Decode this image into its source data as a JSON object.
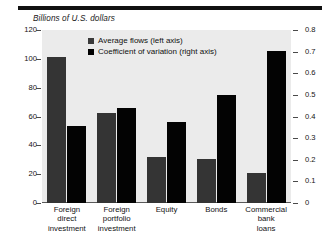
{
  "figure": {
    "axis_title": "Billions of U.S. dollars",
    "top_rule": "horizontal-rule"
  },
  "chart_data": {
    "type": "bar",
    "title": "Billions of U.S. dollars",
    "xlabel": "",
    "ylabel": "Billions of U.S. dollars",
    "y2label": "Coefficient of variation",
    "ylim": [
      0,
      120
    ],
    "y2lim": [
      0,
      0.8
    ],
    "grid": false,
    "legend_position": "top-center",
    "categories": [
      "Foreign direct investment",
      "Foreign portfolio investment",
      "Equity",
      "Bonds",
      "Commercial bank loans"
    ],
    "category_lines": [
      [
        "Foreign",
        "direct",
        "investment"
      ],
      [
        "Foreign",
        "portfolio",
        "investment"
      ],
      [
        "Equity"
      ],
      [
        "Bonds"
      ],
      [
        "Commercial",
        "bank",
        "loans"
      ]
    ],
    "series": [
      {
        "name": "Average flows (left axis)",
        "axis": "left",
        "color": "#343434",
        "values": [
          101,
          62.5,
          32,
          30.5,
          21
        ]
      },
      {
        "name": "Coefficient of variation (right axis)",
        "axis": "right",
        "color": "#030303",
        "values": [
          0.355,
          0.44,
          0.375,
          0.5,
          0.705
        ]
      }
    ],
    "yticks_left": [
      "0",
      "20",
      "40",
      "60",
      "80",
      "100",
      "120"
    ],
    "yticks_left_values": [
      0,
      20,
      40,
      60,
      80,
      100,
      120
    ],
    "yticks_right": [
      "0",
      "0.1",
      "0.2",
      "0.3",
      "0.4",
      "0.5",
      "0.6",
      "0.7",
      "0.8"
    ],
    "yticks_right_values": [
      0,
      0.1,
      0.2,
      0.3,
      0.4,
      0.5,
      0.6,
      0.7,
      0.8
    ]
  },
  "colors": {
    "plot_background": "#ebebeb",
    "page_background": "#ffffff",
    "series_flows": "#343434",
    "series_cv": "#030303",
    "axis": "#4a4a4a",
    "text": "#121212"
  }
}
